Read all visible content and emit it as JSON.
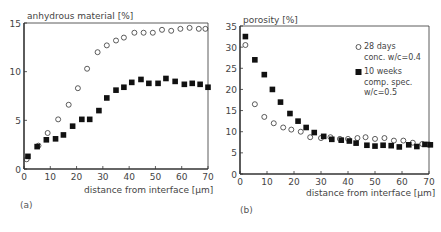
{
  "chart_data": [
    {
      "type": "scatter",
      "panel": "(a)",
      "title": "",
      "ylabel": "anhydrous material [%]",
      "xlabel": "distance from interface [µm]",
      "xlim": [
        0,
        70
      ],
      "ylim": [
        0,
        15
      ],
      "xticks": [
        0,
        10,
        20,
        30,
        40,
        50,
        60,
        70
      ],
      "yticks": [
        0,
        5,
        10,
        15
      ],
      "grid": false,
      "series": [
        {
          "name": "28 days conc. w/c=0.4",
          "marker": "open-circle",
          "x": [
            1,
            5.5,
            9,
            13,
            17,
            20.5,
            24,
            28,
            31.5,
            35,
            38,
            42,
            45.5,
            49,
            52.5,
            56,
            59.5,
            63,
            66.5,
            69
          ],
          "y": [
            1.0,
            2.4,
            3.7,
            5.1,
            6.6,
            8.3,
            10.3,
            12.0,
            12.7,
            13.2,
            13.5,
            14.0,
            14.0,
            14.0,
            14.3,
            14.2,
            14.4,
            14.5,
            14.4,
            14.4
          ]
        },
        {
          "name": "10 weeks comp. spec. w/c=0.5",
          "marker": "filled-square",
          "x": [
            1.5,
            5,
            8.5,
            12,
            15,
            18.5,
            22,
            25,
            28.5,
            31.5,
            35,
            38,
            41,
            44.5,
            47.5,
            51,
            54,
            57.5,
            61,
            64,
            67,
            70
          ],
          "y": [
            1.3,
            2.3,
            3.0,
            3.1,
            3.5,
            4.4,
            5.1,
            5.1,
            6.0,
            7.3,
            8.1,
            8.4,
            8.9,
            9.2,
            8.8,
            8.8,
            9.3,
            9.0,
            8.7,
            8.8,
            8.7,
            8.4
          ]
        }
      ]
    },
    {
      "type": "scatter",
      "panel": "(b)",
      "title": "",
      "ylabel": "porosity [%]",
      "xlabel": "distance from interface [µm]",
      "xlim": [
        0,
        70
      ],
      "ylim": [
        0,
        35
      ],
      "xticks": [
        0,
        10,
        20,
        30,
        40,
        50,
        60,
        70
      ],
      "yticks": [
        0,
        5,
        10,
        15,
        20,
        25,
        30,
        35
      ],
      "grid": false,
      "legend_position": "upper right (inside)",
      "series": [
        {
          "name": "28 days conc. w/c=0.4",
          "marker": "open-circle",
          "x": [
            2,
            5.5,
            9,
            12.5,
            16,
            19,
            22.5,
            26,
            30,
            33.5,
            37,
            40,
            43.5,
            46.5,
            50,
            53.5,
            57,
            60.5,
            64,
            67.5,
            70
          ],
          "y": [
            30.5,
            16.5,
            13.5,
            12.0,
            11.0,
            10.5,
            10.0,
            8.7,
            8.5,
            8.7,
            8.3,
            8.3,
            8.5,
            8.7,
            8.3,
            8.5,
            7.9,
            7.9,
            7.4,
            7.1,
            7.0
          ]
        },
        {
          "name": "10 weeks comp. spec. w/c=0.5",
          "marker": "filled-square",
          "x": [
            2,
            5.5,
            9,
            12,
            15,
            18.5,
            21.5,
            24.5,
            27.5,
            31,
            34,
            37.5,
            40.5,
            43,
            47,
            50,
            53,
            56,
            59,
            62.5,
            65.5,
            68.5,
            70.5
          ],
          "y": [
            32.5,
            27.0,
            23.5,
            20.0,
            17.0,
            14.3,
            12.5,
            11.0,
            9.8,
            8.9,
            8.2,
            8.0,
            7.8,
            7.3,
            6.8,
            6.6,
            6.8,
            6.7,
            6.4,
            6.9,
            6.5,
            7.0,
            6.9
          ]
        }
      ]
    }
  ],
  "charts": {
    "a": {
      "ylabel": "anhydrous material [%]",
      "xlabel": "distance from interface [µm]",
      "panel_label": "(a)"
    },
    "b": {
      "ylabel": "porosity [%]",
      "xlabel": "distance from interface [µm]",
      "panel_label": "(b)",
      "legend": [
        {
          "marker": "open-circle",
          "line1": "28 days",
          "line2": "conc. w/c=0.4",
          "line3": ""
        },
        {
          "marker": "filled-square",
          "line1": "10 weeks",
          "line2": "comp. spec.",
          "line3": "w/c=0.5"
        }
      ]
    }
  },
  "colors": {
    "axis": "#333333",
    "marker": "#111111",
    "text": "#444444"
  }
}
